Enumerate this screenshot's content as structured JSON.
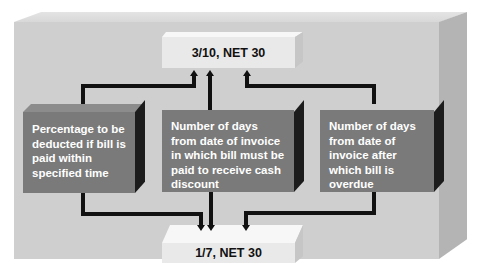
{
  "diagram": {
    "top_term": "3/10, NET 30",
    "bottom_term": "1/7, NET 30",
    "descriptions": [
      {
        "id": "percentage",
        "text": "Percentage to be deducted if bill is paid within specified time"
      },
      {
        "id": "discount-days",
        "text": "Number of days from date of invoice in which bill must be paid to receive cash discount"
      },
      {
        "id": "overdue-days",
        "text": "Number of days from date of invoice after which bill is overdue"
      }
    ],
    "colors": {
      "panel": "#cfcfcf",
      "term_box": "#e9e9e9",
      "desc_box": "#7a7a7a",
      "desc_side": "#1c1c1c",
      "connector": "#111111"
    }
  }
}
